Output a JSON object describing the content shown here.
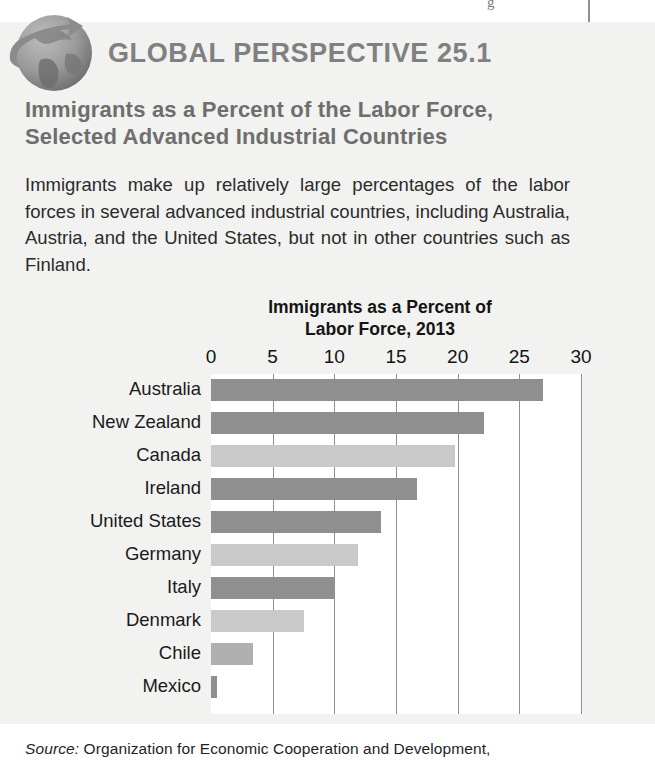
{
  "page_artifacts": {
    "top_glyph": "g",
    "rule": ""
  },
  "feature": {
    "badge_icon": "globe-with-arrow-icon",
    "header_label": "GLOBAL PERSPECTIVE 25.1",
    "title": "Immigrants as a Percent of the Labor Force, Selected Advanced Industrial Countries",
    "body": "Immigrants make up relatively large percentages of the labor forces in several advanced industrial countries, including Australia, Austria, and the United States, but not in other countries such as Finland.",
    "source_prefix": "Source:",
    "source_text": "Organization for Economic Cooperation and Development,"
  },
  "colors": {
    "panel_background": "#f2f2f0",
    "plot_background": "#ffffff",
    "gridline": "#909090",
    "bar_dark": "#8f8f8f",
    "bar_light": "#c9c9c9",
    "header_text": "#808080",
    "title_text": "#6e6e6e"
  },
  "chart_data": {
    "type": "bar",
    "orientation": "horizontal",
    "title": "Immigrants as a Percent of Labor Force, 2013",
    "title_line1": "Immigrants as a Percent of",
    "title_line2": "Labor Force, 2013",
    "xlabel": "",
    "ylabel": "",
    "xlim": [
      0,
      30
    ],
    "ticks": [
      0,
      5,
      10,
      15,
      20,
      25,
      30
    ],
    "tick_labels": [
      "0",
      "5",
      "10",
      "15",
      "20",
      "25",
      "30"
    ],
    "grid": true,
    "legend": "none",
    "categories": [
      "Australia",
      "New Zealand",
      "Canada",
      "Ireland",
      "United States",
      "Germany",
      "Italy",
      "Denmark",
      "Chile",
      "Mexico"
    ],
    "values": [
      26.9,
      22.1,
      19.8,
      16.7,
      13.8,
      11.9,
      10.0,
      7.5,
      3.4,
      0.5
    ],
    "bar_colors": [
      "#8f8f8f",
      "#8f8f8f",
      "#c9c9c9",
      "#8f8f8f",
      "#8f8f8f",
      "#c9c9c9",
      "#8f8f8f",
      "#c9c9c9",
      "#b0b0b0",
      "#8f8f8f"
    ]
  }
}
